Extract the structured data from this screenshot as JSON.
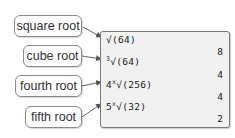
{
  "labels": [
    {
      "text": "square root"
    },
    {
      "text": "cube root"
    },
    {
      "text": "fourth root"
    },
    {
      "text": "fifth root"
    }
  ],
  "screen": {
    "rows": [
      {
        "index": "",
        "expression": "√(64)",
        "result": "8"
      },
      {
        "index": "3",
        "expression": "√(64)",
        "result": "4"
      },
      {
        "index": "4",
        "expression": "√(256)",
        "result": "4"
      },
      {
        "index": "5",
        "expression": "√(32)",
        "result": "2"
      }
    ]
  },
  "colors": {
    "border": "#8a8a8a",
    "screen_bg": "#f1f1f1",
    "arrow": "#555555"
  }
}
